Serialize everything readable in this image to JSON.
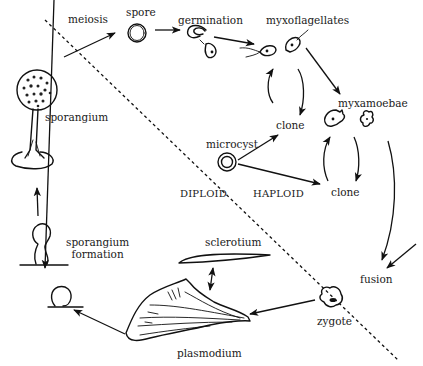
{
  "diagram": {
    "regions": {
      "diploid_label": "DIPLOID",
      "haploid_label": "HAPLOID"
    },
    "stages": {
      "meiosis": "meiosis",
      "spore": "spore",
      "germination": "germination",
      "myxoflagellates": "myxoflagellates",
      "myxamoebae": "myxamoebae",
      "clone_flagellate": "clone",
      "clone_amoebae": "clone",
      "microcyst": "microcyst",
      "fusion": "fusion",
      "zygote": "zygote",
      "plasmodium": "plasmodium",
      "sclerotium": "sclerotium",
      "sporangium_formation_line1": "sporangium",
      "sporangium_formation_line2": "formation",
      "sporangium": "sporangium"
    },
    "edges": [
      {
        "from": "sporangium",
        "to": "spore",
        "label": "meiosis"
      },
      {
        "from": "spore",
        "to": "germination"
      },
      {
        "from": "germination",
        "to": "myxoflagellates"
      },
      {
        "from": "myxoflagellates",
        "to": "clone_flagellate"
      },
      {
        "from": "clone_flagellate",
        "to": "myxoflagellates"
      },
      {
        "from": "myxoflagellates",
        "to": "myxamoebae"
      },
      {
        "from": "myxamoebae",
        "to": "clone_amoebae"
      },
      {
        "from": "clone_amoebae",
        "to": "myxamoebae"
      },
      {
        "from": "microcyst",
        "to": "clone_flagellate"
      },
      {
        "from": "microcyst",
        "to": "clone_amoebae"
      },
      {
        "from": "myxamoebae",
        "to": "fusion"
      },
      {
        "from": "fusion",
        "to": "zygote"
      },
      {
        "from": "zygote",
        "to": "plasmodium"
      },
      {
        "from": "plasmodium",
        "to": "sclerotium",
        "bidirectional": true
      },
      {
        "from": "plasmodium",
        "to": "sporangium_formation"
      },
      {
        "from": "sporangium_formation",
        "to": "sporangium"
      }
    ]
  }
}
